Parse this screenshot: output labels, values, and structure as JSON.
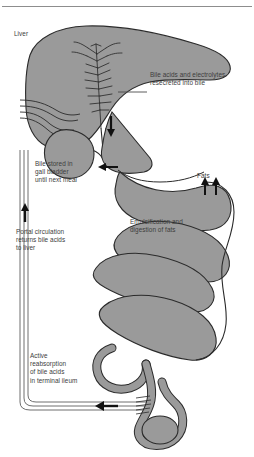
{
  "figure": {
    "type": "anatomical-diagram",
    "background_color": "#ffffff",
    "organ_fill_color": "#9a9a9a",
    "organ_stroke_color": "#2e2e2e",
    "text_color": "#3d3d3d",
    "arrow_color": "#111111",
    "duct_color": "#6f6f6f"
  },
  "labels": {
    "liver": "Liver",
    "resecreted": "Bile acids and electrolytes\nresecreted into bile",
    "gallbladder": "Bile stored in\ngall bladder\nuntil next meal",
    "fats": "Fats",
    "emulsification": "Emulsification and\ndigestion of fats",
    "portal": "Portal circulation\nreturns bile acids\nto liver",
    "ileum": "Active\nreabsorption\nof bile acids\nin terminal ileum"
  },
  "structures": {
    "liver": "liver",
    "gallbladder": "gall-bladder",
    "duodenum": "duodenum",
    "small_intestine": "small-intestine",
    "terminal_ileum": "terminal-ileum",
    "biliary_tree": "biliary-tree",
    "portal_vein": "portal-vein",
    "bile_duct": "common-bile-duct"
  },
  "arrows": {
    "bile_into_duodenum": "down-arrow",
    "bile_from_gallbladder": "left-arrow",
    "fats_uptake": "up-arrow-pair",
    "portal_return": "up-arrow",
    "ileal_reabsorption": "left-arrow"
  }
}
